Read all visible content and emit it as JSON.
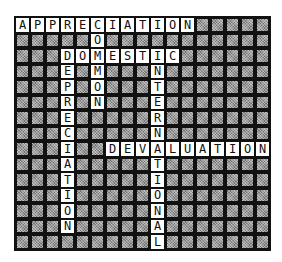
{
  "puzzle": {
    "cols": 17,
    "rows": 15,
    "words": [
      {
        "word": "APPRECIATION",
        "row": 0,
        "col": 0,
        "dir": "across"
      },
      {
        "word": "COMMON",
        "row": 0,
        "col": 5,
        "dir": "down"
      },
      {
        "word": "DOMESTIC",
        "row": 2,
        "col": 3,
        "dir": "across"
      },
      {
        "word": "DEPRECIATION",
        "row": 2,
        "col": 3,
        "dir": "down"
      },
      {
        "word": "INTERNATIONAL",
        "row": 2,
        "col": 9,
        "dir": "down"
      },
      {
        "word": "DEVALUATION",
        "row": 8,
        "col": 6,
        "dir": "across"
      }
    ]
  }
}
